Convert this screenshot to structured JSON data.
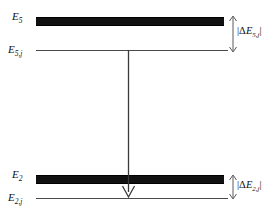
{
  "figure": {
    "type": "energy-level-diagram",
    "title": "",
    "background_color": "#ffffff",
    "line_color": "#000000",
    "thin_line_color": "#4a4a4a",
    "width": 275,
    "height": 214
  },
  "levels": [
    {
      "id": "E5",
      "label_base": "E",
      "label_sub": "5",
      "style": "thick",
      "y": 17,
      "x_start": 36,
      "x_end": 224,
      "label_x": 12,
      "label_y": 11
    },
    {
      "id": "E5j",
      "label_base": "E",
      "label_sub": "5,j",
      "style": "thin",
      "y": 50,
      "x_start": 36,
      "x_end": 228,
      "label_x": 8,
      "label_y": 44
    },
    {
      "id": "E2",
      "label_base": "E",
      "label_sub": "2",
      "style": "thick",
      "y": 175,
      "x_start": 36,
      "x_end": 224,
      "label_x": 12,
      "label_y": 169
    },
    {
      "id": "E2j",
      "label_base": "E",
      "label_sub": "2,j",
      "style": "thin",
      "y": 198,
      "x_start": 36,
      "x_end": 228,
      "label_x": 8,
      "label_y": 192
    }
  ],
  "transition": {
    "id": "transition-5-to-2",
    "direction": "down",
    "x": 128,
    "y_start": 50,
    "y_end": 197,
    "arrowhead": "open-v"
  },
  "gap_measures": [
    {
      "id": "delta-E5j",
      "x": 232,
      "y_top": 17,
      "y_bottom": 50,
      "label_prefix": "|",
      "label_delta": "Δ",
      "label_base": "E",
      "label_sub": "5,j",
      "label_suffix": "|",
      "label_x": 238,
      "label_y": 27
    },
    {
      "id": "delta-E2j",
      "x": 232,
      "y_top": 175,
      "y_bottom": 198,
      "label_prefix": "|",
      "label_delta": "Δ",
      "label_base": "E",
      "label_sub": "2,j",
      "label_suffix": "|",
      "label_x": 238,
      "label_y": 180
    }
  ]
}
